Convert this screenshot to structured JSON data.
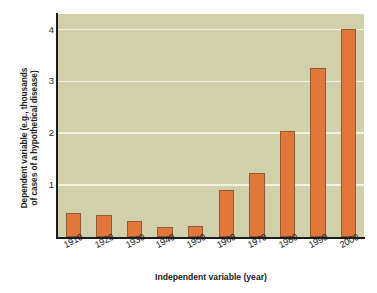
{
  "chart_data": {
    "type": "bar",
    "title": "",
    "subtitle": "",
    "xlabel": "Independent variable (year)",
    "ylabel": "Dependent variable (e.g., thousands of cases of a hypothetical disease)",
    "ylabel_lines": [
      "Dependent variable (e.g., thousands",
      "of cases of a hypothetical disease)"
    ],
    "categories": [
      "1910",
      "1920",
      "1930",
      "1940",
      "1950",
      "1960",
      "1970",
      "1980",
      "1990",
      "2000"
    ],
    "values": [
      0.46,
      0.42,
      0.31,
      0.19,
      0.22,
      0.9,
      1.23,
      2.05,
      3.25,
      4.02
    ],
    "ylim": [
      0,
      4.3
    ],
    "xlim_note": "categorical",
    "yticks": [
      1,
      2,
      3,
      4
    ],
    "ytick_labels": [
      "1",
      "2",
      "3",
      "4"
    ],
    "grid": "horizontal",
    "legend": "none",
    "colors": {
      "bar_fill": "#e1773a",
      "bar_edge": "#8d5a33",
      "plot_background": "#d3d1aa",
      "gridline": "#f3f1df",
      "axis_line": "#1c1c1c",
      "figure_background": "#ffffff",
      "text": "#1a1a1a"
    }
  }
}
